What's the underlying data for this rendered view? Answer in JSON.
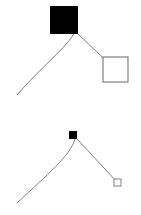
{
  "canvas": {
    "width": 141,
    "height": 215,
    "background": "#ffffff"
  },
  "colors": {
    "filled_node": "#000000",
    "outline_node_stroke": "#808080",
    "outline_node_fill": "#ffffff",
    "curve_stroke": "#808080",
    "line_stroke": "#808080"
  },
  "figures": [
    {
      "id": "figure-top",
      "label": "top-diagram",
      "scale": "large",
      "nodes": [
        {
          "id": "top-filled-square",
          "name": "filled-square-node",
          "style": "filled",
          "x": 50,
          "y": 6,
          "width": 28,
          "height": 28,
          "fill": "#000000",
          "stroke": "#000000"
        },
        {
          "id": "top-outlined-square",
          "name": "outlined-square-node",
          "style": "outline",
          "x": 103,
          "y": 57,
          "width": 25,
          "height": 25,
          "fill": "#ffffff",
          "stroke": "#808080",
          "stroke_width": 1.2
        }
      ],
      "edges": [
        {
          "id": "top-curve",
          "name": "curved-edge",
          "kind": "curve",
          "stroke": "#808080",
          "stroke_width": 1,
          "path": "M 74 34 C 62 52, 40 68, 17 95"
        },
        {
          "id": "top-diagonal",
          "name": "straight-edge",
          "kind": "line",
          "stroke": "#808080",
          "stroke_width": 1,
          "x1": 78,
          "y1": 34,
          "x2": 118,
          "y2": 72
        }
      ]
    },
    {
      "id": "figure-bottom",
      "label": "bottom-diagram",
      "scale": "small",
      "nodes": [
        {
          "id": "bottom-filled-square",
          "name": "filled-square-node",
          "style": "filled",
          "x": 69,
          "y": 131,
          "width": 8,
          "height": 8,
          "fill": "#000000",
          "stroke": "#000000"
        },
        {
          "id": "bottom-outlined-square",
          "name": "outlined-square-node",
          "style": "outline",
          "x": 114,
          "y": 179,
          "width": 7,
          "height": 7,
          "fill": "#ffffff",
          "stroke": "#808080",
          "stroke_width": 1
        }
      ],
      "edges": [
        {
          "id": "bottom-curve",
          "name": "curved-edge",
          "kind": "curve",
          "stroke": "#808080",
          "stroke_width": 1,
          "path": "M 75 139 C 70 156, 48 174, 17 203"
        },
        {
          "id": "bottom-diagonal",
          "name": "straight-edge",
          "kind": "line",
          "stroke": "#808080",
          "stroke_width": 1,
          "x1": 77,
          "y1": 139,
          "x2": 117,
          "y2": 182
        }
      ]
    }
  ]
}
